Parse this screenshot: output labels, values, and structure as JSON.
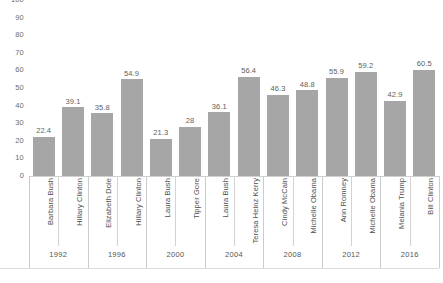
{
  "chart_data": {
    "type": "bar",
    "title": "",
    "subtitle": "",
    "xlabel": "",
    "ylabel": "",
    "ylim": [
      0,
      100
    ],
    "ytick_step": 10,
    "yticks": [
      100,
      90,
      80,
      70,
      60,
      50,
      40,
      30,
      20,
      10,
      0
    ],
    "grid": false,
    "legend": "none",
    "bar_color": "#a6a6a6",
    "categories": [
      "Barbara Bush",
      "Hillary Clinton",
      "Elizabeth Dole",
      "Hillary Clinton",
      "Laura Bush",
      "Tipper Gore",
      "Laura Bush",
      "Teresa Heinz Kerry",
      "Cindy McCain",
      "Michelle Obama",
      "Ann Romney",
      "Michelle Obama",
      "Melania Trump",
      "Bill Clinton"
    ],
    "values": [
      22.4,
      39.1,
      35.8,
      54.9,
      21.3,
      28,
      36.1,
      56.4,
      46.3,
      48.8,
      55.9,
      59.2,
      42.9,
      60.5
    ],
    "value_labels": [
      "22.4",
      "39.1",
      "35.8",
      "54.9",
      "21.3",
      "28",
      "36.1",
      "56.4",
      "46.3",
      "48.8",
      "55.9",
      "59.2",
      "42.9",
      "60.5"
    ],
    "groups": [
      {
        "label": "1992",
        "members": [
          "Barbara Bush",
          "Hillary Clinton"
        ]
      },
      {
        "label": "1996",
        "members": [
          "Elizabeth Dole",
          "Hillary Clinton"
        ]
      },
      {
        "label": "2000",
        "members": [
          "Laura Bush",
          "Tipper Gore"
        ]
      },
      {
        "label": "2004",
        "members": [
          "Laura Bush",
          "Teresa Heinz Kerry"
        ]
      },
      {
        "label": "2008",
        "members": [
          "Cindy McCain",
          "Michelle Obama"
        ]
      },
      {
        "label": "2012",
        "members": [
          "Ann Romney",
          "Michelle Obama"
        ]
      },
      {
        "label": "2016",
        "members": [
          "Melania Trump",
          "Bill Clinton"
        ]
      }
    ],
    "group_labels": [
      "1992",
      "1996",
      "2000",
      "2004",
      "2008",
      "2012",
      "2016"
    ]
  }
}
